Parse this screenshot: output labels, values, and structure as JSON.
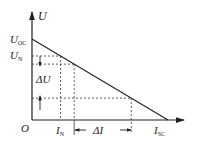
{
  "chart_data": {
    "type": "line",
    "title": "",
    "xlabel": "I",
    "ylabel": "U",
    "origin_label": "O",
    "y_tick_labels": [
      {
        "main": "U",
        "sub": "OC"
      },
      {
        "main": "U",
        "sub": "N"
      }
    ],
    "x_tick_labels": [
      {
        "main": "I",
        "sub": "N"
      },
      {
        "main": "I",
        "sub": "SC"
      }
    ],
    "annotations": {
      "delta_u": "ΔU",
      "delta_i": "ΔI"
    },
    "series": [
      {
        "name": "external characteristic",
        "points": [
          [
            0,
            1.0
          ],
          [
            1.0,
            0
          ]
        ]
      }
    ],
    "reference_points": [
      {
        "name": "rated",
        "i": 0.21,
        "u": 0.79
      },
      {
        "name": "point-2",
        "i": 0.31,
        "u": 0.69
      },
      {
        "name": "point-3",
        "i": 0.73,
        "u": 0.27
      }
    ]
  }
}
